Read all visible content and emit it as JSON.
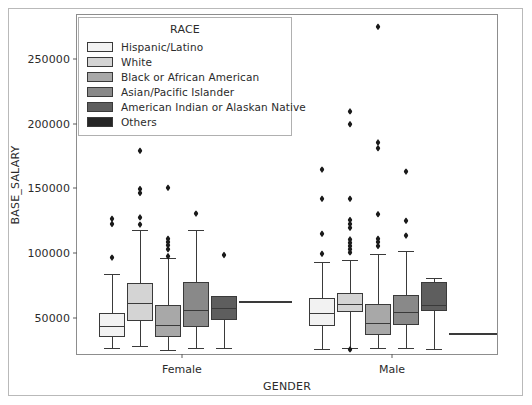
{
  "chart_data": {
    "type": "box",
    "title": "",
    "xlabel": "GENDER",
    "ylabel": "BASE_SALARY",
    "categories": [
      "Female",
      "Male"
    ],
    "ylim": [
      22000,
      284000
    ],
    "yticks": [
      50000,
      100000,
      150000,
      200000,
      250000
    ],
    "ytick_labels": [
      "50000",
      "100000",
      "150000",
      "200000",
      "250000"
    ],
    "grid": false,
    "legend": {
      "title": "RACE",
      "position": "upper left",
      "entries": [
        {
          "label": "Hispanic/Latino",
          "color": "#f2f2f2"
        },
        {
          "label": "White",
          "color": "#d4d4d4"
        },
        {
          "label": "Black or African American",
          "color": "#a8a8a8"
        },
        {
          "label": "Asian/Pacific Islander",
          "color": "#898989"
        },
        {
          "label": "American Indian or Alaskan Native",
          "color": "#5e5e5e"
        },
        {
          "label": "Others",
          "color": "#262626"
        }
      ]
    },
    "series": [
      {
        "name": "Hispanic/Latino",
        "color": "#f2f2f2",
        "boxes": [
          {
            "group": "Female",
            "whislo": 27000,
            "q1": 35500,
            "med": 43500,
            "q3": 53500,
            "whishi": 83500,
            "fliers": [
              96500,
              122500,
              126500
            ]
          },
          {
            "group": "Male",
            "whislo": 25500,
            "q1": 44000,
            "med": 54000,
            "q3": 65500,
            "whishi": 93000,
            "fliers": [
              99500,
              115000,
              142000,
              164500
            ]
          }
        ]
      },
      {
        "name": "White",
        "color": "#d4d4d4",
        "boxes": [
          {
            "group": "Female",
            "whislo": 28000,
            "q1": 47500,
            "med": 61500,
            "q3": 77000,
            "whishi": 117500,
            "fliers": [
              122000,
              127500,
              146500,
              149500,
              179000
            ]
          },
          {
            "group": "Male",
            "whislo": 26500,
            "q1": 54500,
            "med": 61000,
            "q3": 69500,
            "whishi": 95000,
            "fliers": [
              25500,
              100500,
              103000,
              105500,
              108000,
              110500,
              119500,
              122500,
              125500,
              142000,
              199500,
              209500
            ]
          }
        ]
      },
      {
        "name": "Black or African American",
        "color": "#a8a8a8",
        "boxes": [
          {
            "group": "Female",
            "whislo": 25000,
            "q1": 35500,
            "med": 44500,
            "q3": 60000,
            "whishi": 96000,
            "fliers": [
              97500,
              103000,
              106000,
              108500,
              111000,
              150500
            ]
          },
          {
            "group": "Male",
            "whislo": 26500,
            "q1": 36500,
            "med": 46000,
            "q3": 60500,
            "whishi": 99500,
            "fliers": [
              105500,
              108500,
              111000,
              130000,
              181000,
              185500,
              275000
            ]
          }
        ]
      },
      {
        "name": "Asian/Pacific Islander",
        "color": "#898989",
        "boxes": [
          {
            "group": "Female",
            "whislo": 26500,
            "q1": 42500,
            "med": 56000,
            "q3": 77500,
            "whishi": 117500,
            "fliers": [
              130500
            ]
          },
          {
            "group": "Male",
            "whislo": 27000,
            "q1": 44500,
            "med": 54500,
            "q3": 67500,
            "whishi": 101500,
            "fliers": [
              113500,
              125000,
              163000
            ]
          }
        ]
      },
      {
        "name": "American Indian or Alaskan Native",
        "color": "#5e5e5e",
        "boxes": [
          {
            "group": "Female",
            "whislo": 26500,
            "q1": 48500,
            "med": 57500,
            "q3": 67000,
            "whishi": 67000,
            "fliers": [
              98500
            ]
          },
          {
            "group": "Male",
            "whislo": 26000,
            "q1": 55500,
            "med": 59500,
            "q3": 78000,
            "whishi": 80500,
            "fliers": []
          }
        ]
      },
      {
        "name": "Others",
        "color": "#262626",
        "boxes": [
          {
            "group": "Female",
            "whislo": 63000,
            "q1": 63000,
            "med": 63000,
            "q3": 63000,
            "whishi": 63000,
            "fliers": []
          },
          {
            "group": "Male",
            "whislo": 38000,
            "q1": 38000,
            "med": 38000,
            "q3": 38000,
            "whishi": 38000,
            "fliers": []
          }
        ]
      }
    ]
  }
}
